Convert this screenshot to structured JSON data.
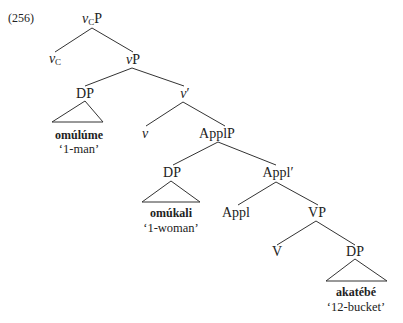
{
  "example_number": "(256)",
  "nodes": {
    "vcp": {
      "head": "v",
      "sub": "C",
      "tail": "P"
    },
    "vc": {
      "head": "v",
      "sub": "C"
    },
    "vp_small": {
      "head": "v",
      "tail": "P"
    },
    "dp1": "DP",
    "vbar": {
      "head": "v",
      "tail": "′"
    },
    "v": "v",
    "applp": "ApplP",
    "dp2": "DP",
    "applbar": "Appl′",
    "appl": "Appl",
    "vp": "VP",
    "V": "V",
    "dp3": "DP"
  },
  "leaves": [
    {
      "word": "omúlúme",
      "gloss": "‘1-man’"
    },
    {
      "word": "omúkali",
      "gloss": "‘1-woman’"
    },
    {
      "word": "akatébé",
      "gloss": "‘12-bucket’"
    }
  ]
}
